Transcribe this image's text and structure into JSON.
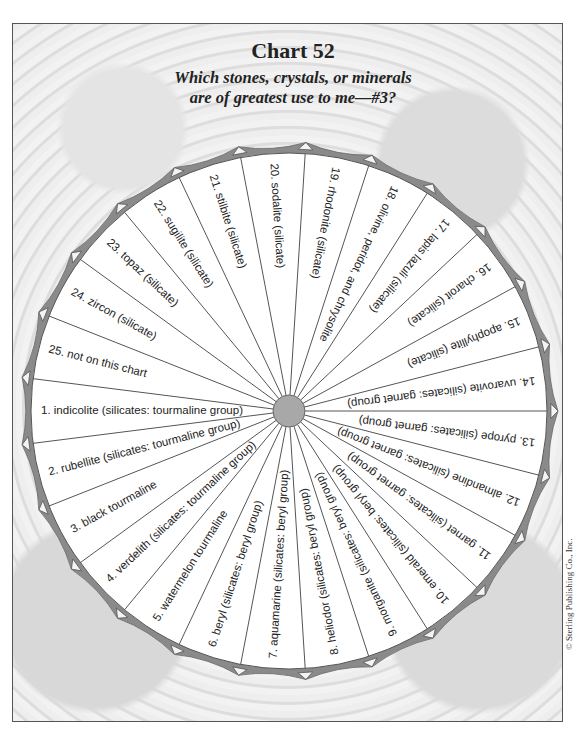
{
  "header": {
    "title": "Chart 52",
    "subtitle_line1": "Which stones, crystals, or minerals",
    "subtitle_line2": "are of greatest use to me—#3?"
  },
  "wheel": {
    "segment_count": 25,
    "center": [
      289,
      411
    ],
    "radius": 258,
    "hub_radius": 16,
    "colors": {
      "rim": "#8a8a8a",
      "hub": "#a8a8a8",
      "lines": "#555555",
      "background": "#ffffff"
    },
    "segments": [
      {
        "number": 1,
        "label": "1.  indicolite (silicates: tourmaline group)"
      },
      {
        "number": 2,
        "label": "2.  rubellite (silicates: tourmaline group)"
      },
      {
        "number": 3,
        "label": "3.  black tourmaline"
      },
      {
        "number": 4,
        "label": "4.  verdelith (silicates: tourmaline group)"
      },
      {
        "number": 5,
        "label": "5.  watermelon tourmaline"
      },
      {
        "number": 6,
        "label": "6.  beryl (silicates: beryl group)"
      },
      {
        "number": 7,
        "label": "7.  aquamarine (silicates: beryl group)"
      },
      {
        "number": 8,
        "label": "8.  heliodor (silicates: beryl group)"
      },
      {
        "number": 9,
        "label": "9.  morganite (silicates: beryl group)"
      },
      {
        "number": 10,
        "label": "10.  emerald (silicates: beryl group)"
      },
      {
        "number": 11,
        "label": "11.  garnet (silicates: garnet group)"
      },
      {
        "number": 12,
        "label": "12.  almandine (silicates: garnet group)"
      },
      {
        "number": 13,
        "label": "13.  pyrope (silicates: garnet group)"
      },
      {
        "number": 14,
        "label": "14.  uvarovite (silicates: garnet group)"
      },
      {
        "number": 15,
        "label": "15.  apophyllite (silicate)"
      },
      {
        "number": 16,
        "label": "16.  charoit (silicate)"
      },
      {
        "number": 17,
        "label": "17.  lapis lazuli (silicate)"
      },
      {
        "number": 18,
        "label": "18.  olivine, peridot, and chrysolite"
      },
      {
        "number": 19,
        "label": "19.  rhodonite (silicate)"
      },
      {
        "number": 20,
        "label": "20.  sodalite (silicate)"
      },
      {
        "number": 21,
        "label": "21.  stilbite (silicate)"
      },
      {
        "number": 22,
        "label": "22.  sugilite (silicate)"
      },
      {
        "number": 23,
        "label": "23.  topaz (silicate)"
      },
      {
        "number": 24,
        "label": "24.  zircon (silicate)"
      },
      {
        "number": 25,
        "label": "25.  not on this chart"
      }
    ]
  },
  "footer": {
    "copyright": "© Sterling Publishing Co., Inc."
  }
}
